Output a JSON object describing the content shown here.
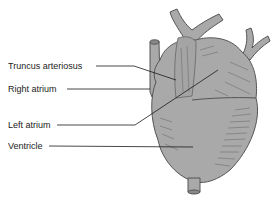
{
  "diagram": {
    "colors": {
      "fill": "#a9a9a9",
      "outline": "#555555",
      "leader": "#1a1a1a",
      "shading": "#6e6e6e",
      "background": "#ffffff"
    },
    "labels": [
      {
        "id": "truncus",
        "text": "Truncus arteriosus",
        "x": 8,
        "y": 62
      },
      {
        "id": "right-atrium",
        "text": "Right atrium",
        "x": 8,
        "y": 85
      },
      {
        "id": "left-atrium",
        "text": "Left atrium",
        "x": 8,
        "y": 121
      },
      {
        "id": "ventricle",
        "text": "Ventricle",
        "x": 8,
        "y": 142
      }
    ]
  }
}
